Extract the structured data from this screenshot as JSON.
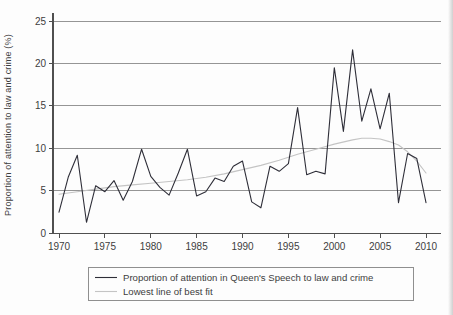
{
  "colors": {
    "background": "#fdfdfd",
    "grid": "#8a8a8a",
    "axis": "#4f4f4f",
    "text": "#3d3d3d",
    "legend_border": "#8f8f8f"
  },
  "chart_data": {
    "type": "line",
    "title": "",
    "xlabel": "",
    "ylabel": "Proportion of attention to law and crime (%)",
    "xlim": [
      1970,
      2010
    ],
    "ylim": [
      0,
      25
    ],
    "xticks": [
      1970,
      1975,
      1980,
      1985,
      1990,
      1995,
      2000,
      2005,
      2010
    ],
    "yticks": [
      0,
      5,
      10,
      15,
      20,
      25
    ],
    "grid": "horizontal",
    "legend_position": "bottom",
    "x": [
      1970,
      1971,
      1972,
      1973,
      1974,
      1975,
      1976,
      1977,
      1978,
      1979,
      1980,
      1981,
      1982,
      1983,
      1984,
      1985,
      1986,
      1987,
      1988,
      1989,
      1990,
      1991,
      1992,
      1993,
      1994,
      1995,
      1996,
      1997,
      1998,
      1999,
      2000,
      2001,
      2002,
      2003,
      2004,
      2005,
      2006,
      2007,
      2008,
      2009,
      2010
    ],
    "series": [
      {
        "name": "Proportion of attention in Queen's Speech to law and crime",
        "color": "#2e2e38",
        "width": 1.1,
        "values": [
          2.5,
          6.6,
          9.2,
          1.3,
          5.6,
          4.9,
          6.2,
          3.9,
          6.1,
          9.9,
          6.7,
          5.4,
          4.5,
          7.1,
          9.9,
          4.4,
          4.9,
          6.5,
          6.1,
          7.9,
          8.5,
          3.7,
          3.0,
          7.9,
          7.3,
          8.2,
          14.8,
          6.9,
          7.3,
          7.0,
          19.5,
          12.0,
          21.6,
          13.2,
          17.0,
          12.3,
          16.5,
          3.6,
          9.4,
          8.8,
          3.6
        ]
      },
      {
        "name": "Lowest line of best fit",
        "color": "#c4c4c4",
        "width": 1.1,
        "x": [
          1970,
          1972,
          1974,
          1976,
          1978,
          1980,
          1982,
          1984,
          1986,
          1988,
          1990,
          1992,
          1994,
          1996,
          1998,
          2000,
          2002,
          2003,
          2004,
          2005,
          2006,
          2007,
          2008,
          2009,
          2010
        ],
        "values": [
          4.6,
          4.9,
          5.2,
          5.5,
          5.7,
          5.9,
          6.1,
          6.3,
          6.6,
          7.0,
          7.5,
          8.0,
          8.6,
          9.3,
          9.9,
          10.5,
          11.0,
          11.2,
          11.2,
          11.1,
          10.8,
          10.4,
          9.6,
          8.5,
          7.1
        ]
      }
    ]
  }
}
